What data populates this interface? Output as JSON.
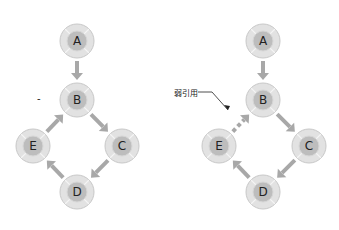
{
  "diagrams": [
    {
      "id": "left",
      "nodes": [
        {
          "label": "A",
          "x": 77,
          "y": 41
        },
        {
          "label": "B",
          "x": 77,
          "y": 100
        },
        {
          "label": "C",
          "x": 122,
          "y": 146
        },
        {
          "label": "D",
          "x": 77,
          "y": 192
        },
        {
          "label": "E",
          "x": 33,
          "y": 146
        }
      ],
      "edges": [
        {
          "from": "A",
          "to": "B",
          "style": "solid"
        },
        {
          "from": "B",
          "to": "C",
          "style": "solid"
        },
        {
          "from": "C",
          "to": "D",
          "style": "solid"
        },
        {
          "from": "D",
          "to": "E",
          "style": "solid"
        },
        {
          "from": "E",
          "to": "B",
          "style": "solid"
        }
      ],
      "marker": "-"
    },
    {
      "id": "right",
      "nodes": [
        {
          "label": "A",
          "x": 263,
          "y": 41
        },
        {
          "label": "B",
          "x": 263,
          "y": 100
        },
        {
          "label": "C",
          "x": 309,
          "y": 146
        },
        {
          "label": "D",
          "x": 263,
          "y": 192
        },
        {
          "label": "E",
          "x": 219,
          "y": 146
        }
      ],
      "edges": [
        {
          "from": "A",
          "to": "B",
          "style": "solid"
        },
        {
          "from": "B",
          "to": "C",
          "style": "solid"
        },
        {
          "from": "C",
          "to": "D",
          "style": "solid"
        },
        {
          "from": "D",
          "to": "E",
          "style": "solid"
        },
        {
          "from": "E",
          "to": "B",
          "style": "dashed"
        }
      ],
      "annotation": "弱引用"
    }
  ],
  "colors": {
    "arrow": "#a8a8a8",
    "node_outer": "#e2e2e2",
    "node_ring": "#c8c8c8",
    "node_inner": "#bdbdbd",
    "text": "#222222"
  }
}
